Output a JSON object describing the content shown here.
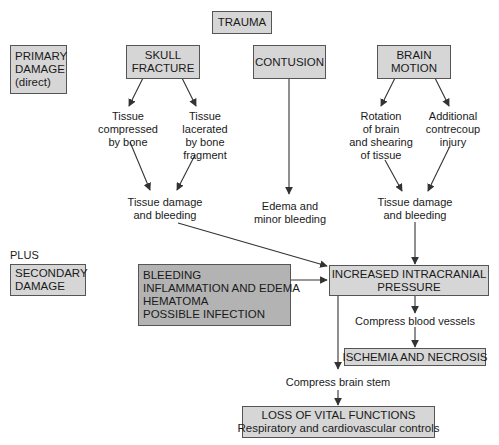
{
  "nodes": {
    "trauma": {
      "lines": [
        "TRAUMA"
      ]
    },
    "primary_damage": {
      "lines": [
        "PRIMARY",
        "DAMAGE",
        "(direct)"
      ]
    },
    "skull_fracture": {
      "lines": [
        "SKULL",
        "FRACTURE"
      ]
    },
    "contusion": {
      "lines": [
        "CONTUSION"
      ]
    },
    "brain_motion": {
      "lines": [
        "BRAIN",
        "MOTION"
      ]
    },
    "tissue_compressed": {
      "lines": [
        "Tissue",
        "compressed",
        "by bone"
      ]
    },
    "tissue_lacerated": {
      "lines": [
        "Tissue",
        "lacerated",
        "by bone",
        "fragment"
      ]
    },
    "rotation": {
      "lines": [
        "Rotation",
        "of brain",
        "and shearing",
        "of tissue"
      ]
    },
    "contrecoup": {
      "lines": [
        "Additional",
        "contrecoup",
        "injury"
      ]
    },
    "tissue_damage_left": {
      "lines": [
        "Tissue damage",
        "and bleeding"
      ]
    },
    "edema_minor": {
      "lines": [
        "Edema and",
        "minor bleeding"
      ]
    },
    "tissue_damage_right": {
      "lines": [
        "Tissue damage",
        "and bleeding"
      ]
    },
    "plus": {
      "lines": [
        "PLUS"
      ]
    },
    "secondary_damage": {
      "lines": [
        "SECONDARY",
        "DAMAGE"
      ]
    },
    "secondary_causes": {
      "lines": [
        "BLEEDING",
        "INFLAMMATION AND EDEMA",
        "HEMATOMA",
        "POSSIBLE INFECTION"
      ]
    },
    "increased_icp": {
      "lines": [
        "INCREASED INTRACRANIAL",
        "PRESSURE"
      ]
    },
    "compress_vessels": {
      "lines": [
        "Compress blood vessels"
      ]
    },
    "ischemia": {
      "lines": [
        "ISCHEMIA AND NECROSIS"
      ]
    },
    "compress_stem": {
      "lines": [
        "Compress brain stem"
      ]
    },
    "loss_vital": {
      "lines": [
        "LOSS OF VITAL FUNCTIONS",
        "Respiratory and cardiovascular controls"
      ]
    }
  },
  "colors": {
    "box_fill": "#d6d6d6",
    "box_fill_dark": "#b3b3b3",
    "border": "#555555",
    "arrow": "#333333"
  }
}
